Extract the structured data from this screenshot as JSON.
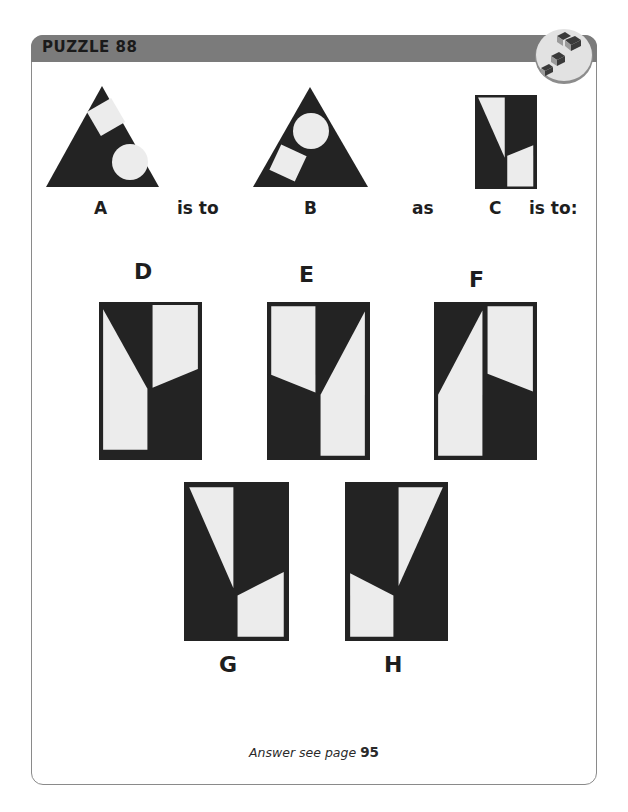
{
  "header": {
    "title": "PUZZLE 88",
    "badge_icon": "isometric-blocks-icon"
  },
  "analogy": {
    "label_a": "A",
    "connector_1": "is to",
    "label_b": "B",
    "connector_2": "as",
    "label_c": "C",
    "connector_3": "is to:"
  },
  "options": [
    {
      "label": "D"
    },
    {
      "label": "E"
    },
    {
      "label": "F"
    },
    {
      "label": "G"
    },
    {
      "label": "H"
    }
  ],
  "footer": {
    "answer_prefix": "Answer see page",
    "answer_page": "95"
  },
  "colors": {
    "header_bar": "#7b7b7b",
    "shape_dark": "#232323",
    "shape_light": "#ececec",
    "frame_border": "#8a8a8a"
  }
}
